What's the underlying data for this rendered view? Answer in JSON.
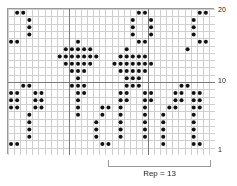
{
  "chart_data": {
    "type": "heatmap",
    "title": "",
    "subtitle": "",
    "xlabel": "",
    "ylabel": "",
    "grid": true,
    "legend_position": "none",
    "columns": 34,
    "rows": 20,
    "row_direction": "bottom-to-top",
    "row_tick_labels": [
      "20",
      "10",
      "1"
    ],
    "row_ticks": [
      20,
      10,
      1
    ],
    "heavy_gridlines": {
      "vertical_after_columns": [
        10,
        23
      ],
      "horizontal_after_rows": [
        10
      ]
    },
    "symbols": {
      "filled": "knit-dot",
      "empty": "blank"
    },
    "repeat": {
      "label": "Rep = 13",
      "stitches": 13,
      "start_column": 11,
      "end_column": 23
    },
    "motifs": [
      "J",
      "O",
      "Y",
      "diamond-tree"
    ],
    "filled_cells_by_row": {
      "20": [
        2,
        3,
        22,
        23,
        32,
        33
      ],
      "19": [
        4,
        21,
        24,
        31
      ],
      "18": [
        4,
        21,
        24,
        31
      ],
      "17": [
        4,
        21,
        24,
        31
      ],
      "16": [
        1,
        2,
        12,
        22,
        23,
        32,
        33
      ],
      "15": [
        10,
        11,
        12,
        13,
        14,
        20,
        30
      ],
      "14": [
        9,
        10,
        11,
        12,
        13,
        14,
        15,
        19,
        20,
        21,
        22,
        23
      ],
      "13": [
        10,
        11,
        12,
        13,
        14,
        18,
        19,
        20,
        21,
        22,
        23,
        24
      ],
      "12": [
        11,
        12,
        13,
        19,
        20,
        21,
        22,
        23
      ],
      "11": [
        12,
        20,
        21,
        22
      ],
      "10": [
        3,
        4,
        11,
        12,
        13,
        20,
        21,
        22,
        29,
        30
      ],
      "9": [
        1,
        2,
        5,
        6,
        12,
        13,
        19,
        20,
        23,
        24,
        28,
        29,
        31,
        32
      ],
      "8": [
        1,
        2,
        5,
        6,
        12,
        19,
        20,
        23,
        24,
        28,
        29,
        31,
        32
      ],
      "7": [
        1,
        2,
        5,
        6,
        12,
        16,
        17,
        19,
        23,
        27,
        28,
        31,
        32
      ],
      "6": [
        4,
        12,
        16,
        19,
        23,
        26,
        31
      ],
      "5": [
        4,
        15,
        19,
        23,
        26,
        31
      ],
      "4": [
        4,
        15,
        19,
        23,
        26,
        31
      ],
      "3": [
        4,
        15,
        19,
        23,
        26,
        31
      ],
      "2": [
        1,
        2,
        16,
        17,
        26,
        31,
        32
      ],
      "1": []
    }
  },
  "labels": {
    "top_row": "20",
    "mid_row": "10",
    "bottom_row": "1",
    "repeat_text": "Rep = 13"
  },
  "colors": {
    "dot": "#111111",
    "grid_line": "#cfcfcf",
    "heavy_line": "#7a7a7a",
    "border": "#9a9a9a",
    "background": "#ffffff",
    "text": "#1a1a1a"
  }
}
